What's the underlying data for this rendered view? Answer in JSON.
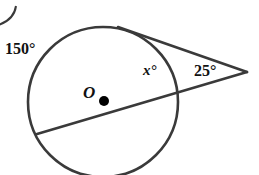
{
  "figure": {
    "center_label": "O",
    "arc_label": "150°",
    "angle_inner_label": "x°",
    "angle_external_label": "25°",
    "colors": {
      "stroke": "#3a3a3a",
      "text": "#111111",
      "background": "#ffffff"
    },
    "geometry": {
      "circle": {
        "cx": 103,
        "cy": 102,
        "r": 75
      },
      "center_dot": {
        "cx": 104,
        "cy": 101,
        "r": 5
      },
      "external_vertex": {
        "x": 247,
        "y": 72
      },
      "tangent_start": {
        "x": 118,
        "y": 27
      },
      "secant_start": {
        "x": 37,
        "y": 134
      }
    }
  }
}
